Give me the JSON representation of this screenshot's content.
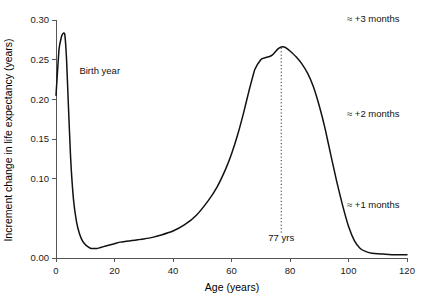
{
  "chart_data": {
    "type": "line",
    "title": "",
    "xlabel": "Age (years)",
    "ylabel": "Increment change in life expectancy (years)",
    "xlim": [
      0,
      120
    ],
    "ylim": [
      0.0,
      0.3
    ],
    "grid": false,
    "legend": null,
    "xticks": [
      0,
      20,
      40,
      60,
      80,
      100,
      120
    ],
    "xticklabels": [
      "0",
      "20",
      "40",
      "60",
      "80",
      "100",
      "120"
    ],
    "yticks": [
      0.0,
      0.1,
      0.15,
      0.2,
      0.25,
      0.3
    ],
    "yticklabels": [
      "0.00",
      "0.10",
      "0.15",
      "0.20",
      "0.25",
      "0.30"
    ],
    "series": [
      {
        "name": "Increment change in life expectancy",
        "color": "#111111",
        "x": [
          0.0,
          1.0,
          1.8,
          2.4,
          3.0,
          3.6,
          4.2,
          5.0,
          6.0,
          7.0,
          8.0,
          9.0,
          10.0,
          11.0,
          12.0,
          13.0,
          14.0,
          15.0,
          16.0,
          18.0,
          20.0,
          22.0,
          24.0,
          26.0,
          28.0,
          30.0,
          33.0,
          36.0,
          40.0,
          44.0,
          48.0,
          52.0,
          55.0,
          58.0,
          60.0,
          62.0,
          64.0,
          66.0,
          68.0,
          70.0,
          71.0,
          72.0,
          73.0,
          74.0,
          75.0,
          76.0,
          77.0,
          78.0,
          79.0,
          80.0,
          82.0,
          84.0,
          86.0,
          88.0,
          90.0,
          92.0,
          94.0,
          96.0,
          98.0,
          100.0,
          102.0,
          104.0,
          106.0,
          108.0,
          112.0,
          116.0,
          120.0
        ],
        "y": [
          0.205,
          0.262,
          0.278,
          0.283,
          0.282,
          0.251,
          0.196,
          0.126,
          0.073,
          0.046,
          0.031,
          0.022,
          0.017,
          0.014,
          0.012,
          0.012,
          0.012,
          0.013,
          0.014,
          0.016,
          0.018,
          0.02,
          0.021,
          0.022,
          0.023,
          0.024,
          0.026,
          0.029,
          0.034,
          0.042,
          0.054,
          0.072,
          0.089,
          0.112,
          0.131,
          0.154,
          0.181,
          0.211,
          0.238,
          0.25,
          0.252,
          0.253,
          0.254,
          0.256,
          0.26,
          0.264,
          0.266,
          0.266,
          0.264,
          0.261,
          0.254,
          0.245,
          0.233,
          0.216,
          0.192,
          0.163,
          0.129,
          0.096,
          0.066,
          0.04,
          0.022,
          0.012,
          0.008,
          0.006,
          0.005,
          0.004,
          0.004
        ]
      }
    ],
    "annotations": [
      {
        "id": "birth-year",
        "label": "Birth year",
        "x": 8.0,
        "y": 0.232,
        "anchor": "start"
      },
      {
        "id": "peak-age",
        "label": "77 yrs",
        "x": 77.0,
        "y": 0.022,
        "anchor": "middle"
      }
    ],
    "markers": [
      {
        "id": "peak-marker",
        "type": "vline",
        "x": 77.0,
        "y_from": 0.032,
        "y_to": 0.266,
        "style": "dotted"
      }
    ],
    "margin_notes": [
      {
        "id": "note-3-months",
        "label": "≈ +3 months",
        "y": 0.297
      },
      {
        "id": "note-2-months",
        "label": "≈ +2 months",
        "y": 0.178
      },
      {
        "id": "note-1-months",
        "label": "≈ +1 months",
        "y": 0.063
      }
    ]
  }
}
